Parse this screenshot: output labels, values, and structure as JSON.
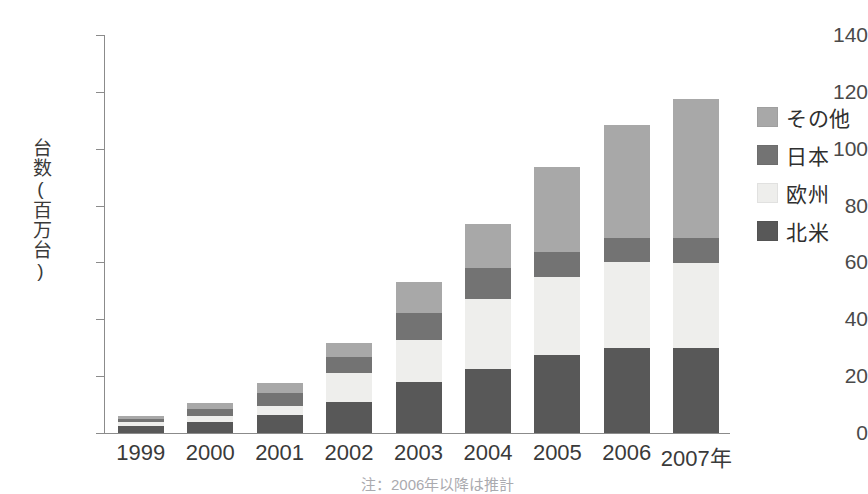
{
  "top_caption": "",
  "chart_data": {
    "type": "bar",
    "subtype": "stacked-bar",
    "title": "",
    "xlabel": "",
    "ylabel": "台数(百万台)",
    "ylim": [
      0,
      140
    ],
    "yticks": [
      0,
      20,
      40,
      60,
      80,
      100,
      120,
      140
    ],
    "ytick_labels": [
      "0",
      "20",
      "40",
      "60",
      "80",
      "100",
      "120",
      "140"
    ],
    "grid": false,
    "legend_position": "right",
    "categories": [
      "1999",
      "2000",
      "2001",
      "2002",
      "2003",
      "2004",
      "2005",
      "2006",
      "2007年"
    ],
    "series": [
      {
        "name": "北米",
        "color": "#585858",
        "values": [
          2.5,
          4.0,
          6.3,
          10.9,
          17.9,
          22.5,
          27.4,
          29.9,
          29.9
        ]
      },
      {
        "name": "欧州",
        "color": "#eeeeec",
        "values": [
          1.3,
          2.0,
          3.2,
          10.2,
          14.8,
          24.6,
          27.5,
          30.2,
          29.9
        ]
      },
      {
        "name": "日本",
        "color": "#737373",
        "values": [
          1.2,
          2.5,
          4.5,
          5.6,
          9.5,
          10.9,
          8.8,
          8.5,
          8.8
        ]
      },
      {
        "name": "その他",
        "color": "#a8a8a8",
        "values": [
          1.0,
          2.0,
          3.5,
          5.0,
          10.9,
          15.5,
          29.8,
          39.7,
          48.9
        ]
      }
    ],
    "totals": [
      6.0,
      10.5,
      17.5,
      31.7,
      53.1,
      73.5,
      93.5,
      108.3,
      117.5
    ]
  },
  "legend": {
    "items": [
      {
        "label": "その他",
        "color": "#a8a8a8"
      },
      {
        "label": "日本",
        "color": "#737373"
      },
      {
        "label": "欧州",
        "color": "#eeeeec"
      },
      {
        "label": "北米",
        "color": "#585858"
      }
    ]
  },
  "footnote": "注：2006年以降は推計",
  "colors": {
    "axis": "#8b8b8b",
    "text": "#3a3a3a",
    "background": "#ffffff"
  }
}
